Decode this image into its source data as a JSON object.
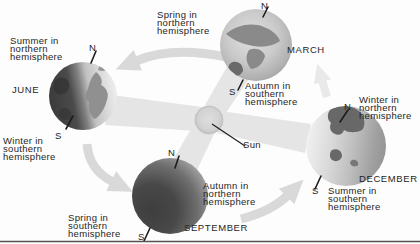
{
  "diagram": {
    "type": "earth-seasons-orbit-diagram",
    "sun": {
      "label": "Sun"
    },
    "earths": [
      {
        "month": "JUNE",
        "north_pole": "N",
        "south_pole": "S",
        "season_north": "Summer in\nnorthern\nhemisphere",
        "season_south": "Winter in\nsouthern\nhemisphere"
      },
      {
        "month": "MARCH",
        "north_pole": "N",
        "south_pole": "S",
        "season_north": "Spring in\nnorthern\nhemisphere",
        "season_south": "Autumn in\nsouthern\nhemisphere"
      },
      {
        "month": "SEPTEMBER",
        "north_pole": "N",
        "south_pole": "S",
        "season_north": "Autumn in\nnorthern\nhemisphere",
        "season_south": "Spring in\nsouthern\nhemisphere"
      },
      {
        "month": "DECEMBER",
        "north_pole": "N",
        "south_pole": "S",
        "season_north": "Winter in\nnorthern\nhemisphere",
        "season_south": "Summer in\nsouthern\nhemisphere"
      }
    ],
    "colors": {
      "background": "#fdfdfd",
      "text": "#262626",
      "light_beam": "#e5e5e5",
      "orbit_arrow": "#d9d9d9",
      "sun_fill": "#d3d3d3",
      "earth_shadow": "#3e3e3e",
      "earth_lit": "#e8e8e8",
      "continent": "#8a8a8a",
      "baseline": "#555555"
    }
  }
}
